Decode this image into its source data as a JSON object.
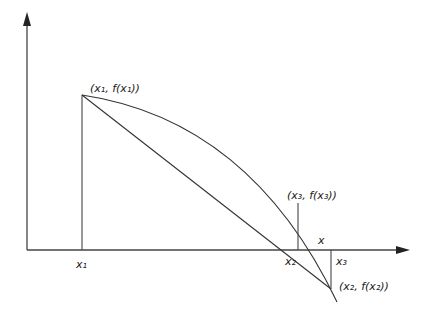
{
  "diagram": {
    "type": "secant-method illustration",
    "labels": {
      "p1": "(x₁, f(x₁))",
      "p3": "(x₃, f(x₃))",
      "p2": "(x₂, f(x₂))",
      "x": "x",
      "x1": "x₁",
      "x2": "x₂",
      "x3": "x₃"
    },
    "colors": {
      "line": "#333333",
      "background": "#ffffff"
    }
  }
}
